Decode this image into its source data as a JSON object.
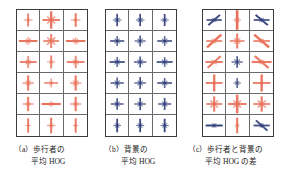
{
  "figure": {
    "type": "hog-feature-visualization",
    "panel_count": 3,
    "grid": {
      "columns": 3,
      "rows": 6
    },
    "colors": {
      "pedestrian_orange": "#e8715a",
      "background_navy": "#2e3c78",
      "cell_border": "#6a6a6a",
      "panel_border": "#3c3c3c",
      "background": "#ffffff",
      "text": "#1a1a1a"
    }
  },
  "panels": [
    {
      "id": "a",
      "tag": "（a）",
      "caption_line1": "歩行者の",
      "caption_line2": "平均 HOG",
      "color": "#e8715a",
      "cells": [
        {
          "color": "#e8715a",
          "weights": [
            0.55,
            0.3,
            0.9,
            0.3
          ],
          "scale": 0.72
        },
        {
          "color": "#e8715a",
          "weights": [
            0.85,
            0.55,
            0.95,
            0.55
          ],
          "scale": 0.92
        },
        {
          "color": "#e8715a",
          "weights": [
            0.55,
            0.28,
            0.92,
            0.28
          ],
          "scale": 0.74
        },
        {
          "color": "#e8715a",
          "weights": [
            0.95,
            0.4,
            0.45,
            0.35
          ],
          "scale": 0.88
        },
        {
          "color": "#e8715a",
          "weights": [
            0.82,
            0.6,
            0.82,
            0.58
          ],
          "scale": 0.86
        },
        {
          "color": "#e8715a",
          "weights": [
            0.95,
            0.35,
            0.42,
            0.4
          ],
          "scale": 0.88
        },
        {
          "color": "#e8715a",
          "weights": [
            0.88,
            0.4,
            0.7,
            0.38
          ],
          "scale": 0.86
        },
        {
          "color": "#e8715a",
          "weights": [
            0.5,
            0.3,
            0.88,
            0.3
          ],
          "scale": 0.74
        },
        {
          "color": "#e8715a",
          "weights": [
            0.88,
            0.38,
            0.72,
            0.4
          ],
          "scale": 0.86
        },
        {
          "color": "#e8715a",
          "weights": [
            0.62,
            0.4,
            0.92,
            0.4
          ],
          "scale": 0.82
        },
        {
          "color": "#e8715a",
          "weights": [
            0.8,
            0.32,
            0.58,
            0.32
          ],
          "scale": 0.78
        },
        {
          "color": "#e8715a",
          "weights": [
            0.6,
            0.42,
            0.92,
            0.42
          ],
          "scale": 0.82
        },
        {
          "color": "#e8715a",
          "weights": [
            0.62,
            0.35,
            0.9,
            0.35
          ],
          "scale": 0.8
        },
        {
          "color": "#e8715a",
          "weights": [
            0.98,
            0.3,
            0.35,
            0.28
          ],
          "scale": 0.88
        },
        {
          "color": "#e8715a",
          "weights": [
            0.6,
            0.35,
            0.9,
            0.35
          ],
          "scale": 0.8
        },
        {
          "color": "#e8715a",
          "weights": [
            0.35,
            0.25,
            0.95,
            0.25
          ],
          "scale": 0.72
        },
        {
          "color": "#e8715a",
          "weights": [
            0.5,
            0.3,
            0.95,
            0.3
          ],
          "scale": 0.78
        },
        {
          "color": "#e8715a",
          "weights": [
            0.35,
            0.25,
            0.95,
            0.25
          ],
          "scale": 0.72
        }
      ]
    },
    {
      "id": "b",
      "tag": "（b）",
      "caption_line1": "背景の",
      "caption_line2": "平均 HOG",
      "color": "#2e3c78",
      "cells": [
        {
          "color": "#2e3c78",
          "weights": [
            0.55,
            0.45,
            0.88,
            0.45
          ],
          "scale": 0.7
        },
        {
          "color": "#2e3c78",
          "weights": [
            0.55,
            0.45,
            0.88,
            0.45
          ],
          "scale": 0.7
        },
        {
          "color": "#2e3c78",
          "weights": [
            0.52,
            0.42,
            0.88,
            0.42
          ],
          "scale": 0.68
        },
        {
          "color": "#2e3c78",
          "weights": [
            0.88,
            0.45,
            0.7,
            0.45
          ],
          "scale": 0.72
        },
        {
          "color": "#2e3c78",
          "weights": [
            0.7,
            0.48,
            0.8,
            0.48
          ],
          "scale": 0.7
        },
        {
          "color": "#2e3c78",
          "weights": [
            0.88,
            0.45,
            0.68,
            0.45
          ],
          "scale": 0.72
        },
        {
          "color": "#2e3c78",
          "weights": [
            0.92,
            0.45,
            0.68,
            0.45
          ],
          "scale": 0.74
        },
        {
          "color": "#2e3c78",
          "weights": [
            0.78,
            0.48,
            0.78,
            0.48
          ],
          "scale": 0.72
        },
        {
          "color": "#2e3c78",
          "weights": [
            0.92,
            0.45,
            0.66,
            0.45
          ],
          "scale": 0.74
        },
        {
          "color": "#2e3c78",
          "weights": [
            0.82,
            0.45,
            0.75,
            0.45
          ],
          "scale": 0.72
        },
        {
          "color": "#2e3c78",
          "weights": [
            0.72,
            0.46,
            0.82,
            0.46
          ],
          "scale": 0.72
        },
        {
          "color": "#2e3c78",
          "weights": [
            0.88,
            0.44,
            0.7,
            0.44
          ],
          "scale": 0.72
        },
        {
          "color": "#2e3c78",
          "weights": [
            0.8,
            0.45,
            0.8,
            0.45
          ],
          "scale": 0.72
        },
        {
          "color": "#2e3c78",
          "weights": [
            0.72,
            0.46,
            0.85,
            0.46
          ],
          "scale": 0.72
        },
        {
          "color": "#2e3c78",
          "weights": [
            0.78,
            0.45,
            0.82,
            0.45
          ],
          "scale": 0.72
        },
        {
          "color": "#2e3c78",
          "weights": [
            0.5,
            0.4,
            0.92,
            0.4
          ],
          "scale": 0.7
        },
        {
          "color": "#2e3c78",
          "weights": [
            0.52,
            0.42,
            0.92,
            0.42
          ],
          "scale": 0.7
        },
        {
          "color": "#2e3c78",
          "weights": [
            0.5,
            0.4,
            0.92,
            0.4
          ],
          "scale": 0.7
        }
      ]
    },
    {
      "id": "c",
      "tag": "（c）",
      "caption_line1": "歩行者と背景の",
      "caption_line2": "平均 HOG の差",
      "color": "#e8715a",
      "cells": [
        {
          "color": "#2e3c78",
          "weights": [
            0.85,
            0.92,
            0.3,
            0.35
          ],
          "scale": 0.8
        },
        {
          "color": "#e8715a",
          "weights": [
            0.35,
            0.3,
            1.0,
            0.3
          ],
          "scale": 0.98
        },
        {
          "color": "#2e3c78",
          "weights": [
            0.85,
            0.35,
            0.3,
            0.92
          ],
          "scale": 0.8
        },
        {
          "color": "#e8715a",
          "weights": [
            0.75,
            0.95,
            0.25,
            0.3
          ],
          "scale": 0.95
        },
        {
          "color": "#e8715a",
          "weights": [
            0.75,
            0.45,
            0.85,
            0.45
          ],
          "scale": 0.88
        },
        {
          "color": "#e8715a",
          "weights": [
            0.75,
            0.3,
            0.25,
            0.95
          ],
          "scale": 0.95
        },
        {
          "color": "#e8715a",
          "weights": [
            0.85,
            0.9,
            0.25,
            0.35
          ],
          "scale": 0.92
        },
        {
          "color": "#2e3c78",
          "weights": [
            0.7,
            0.5,
            0.8,
            0.5
          ],
          "scale": 0.72
        },
        {
          "color": "#e8715a",
          "weights": [
            0.9,
            0.3,
            0.25,
            0.88
          ],
          "scale": 0.95
        },
        {
          "color": "#e8715a",
          "weights": [
            0.8,
            0.2,
            0.9,
            0.2
          ],
          "scale": 0.95
        },
        {
          "color": "#2e3c78",
          "weights": [
            0.55,
            0.45,
            0.8,
            0.45
          ],
          "scale": 0.62
        },
        {
          "color": "#e8715a",
          "weights": [
            0.8,
            0.2,
            0.9,
            0.2
          ],
          "scale": 0.95
        },
        {
          "color": "#e8715a",
          "weights": [
            0.8,
            0.55,
            0.85,
            0.55
          ],
          "scale": 0.9
        },
        {
          "color": "#e8715a",
          "weights": [
            0.85,
            0.5,
            0.95,
            0.5
          ],
          "scale": 0.98
        },
        {
          "color": "#e8715a",
          "weights": [
            0.8,
            0.55,
            0.85,
            0.55
          ],
          "scale": 0.9
        },
        {
          "color": "#2e3c78",
          "weights": [
            0.95,
            0.35,
            0.28,
            0.35
          ],
          "scale": 0.8
        },
        {
          "color": "#e8715a",
          "weights": [
            0.28,
            0.3,
            0.95,
            0.3
          ],
          "scale": 0.78
        },
        {
          "color": "#2e3c78",
          "weights": [
            0.85,
            0.3,
            0.3,
            0.85
          ],
          "scale": 0.82
        }
      ]
    }
  ]
}
